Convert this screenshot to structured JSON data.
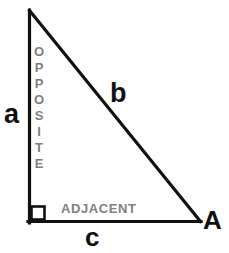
{
  "figure": {
    "canvas": {
      "width": 229,
      "height": 253
    },
    "background_color": "#ffffff",
    "stroke_color": "#111111",
    "annotation_color": "#808080"
  },
  "labels": {
    "leg_vertical": "a",
    "hypotenuse": "b",
    "leg_horizontal": "c",
    "vertex_angle": "A",
    "opposite": "OPPOSITE",
    "opposite_letters": [
      "O",
      "P",
      "P",
      "O",
      "S",
      "I",
      "T",
      "E"
    ],
    "adjacent": "ADJACENT"
  },
  "caption": {
    "text": "",
    "note": "bottom caption row is cropped; only letter tops visible"
  },
  "chart_data": {
    "type": "diagram",
    "shape": "right triangle",
    "vertices": [
      {
        "name": "apex",
        "x": 29,
        "y": 10
      },
      {
        "name": "right-angle",
        "x": 29,
        "y": 222
      },
      {
        "name": "A",
        "x": 200,
        "y": 222
      }
    ],
    "sides": [
      {
        "name": "a",
        "role": "opposite",
        "from": "apex",
        "to": "right-angle"
      },
      {
        "name": "b",
        "role": "hypotenuse",
        "from": "apex",
        "to": "A"
      },
      {
        "name": "c",
        "role": "adjacent",
        "from": "right-angle",
        "to": "A"
      }
    ],
    "angles": [
      {
        "vertex": "right-angle",
        "measure_deg": 90,
        "marker": "square"
      },
      {
        "vertex": "A",
        "label": "A"
      }
    ]
  }
}
